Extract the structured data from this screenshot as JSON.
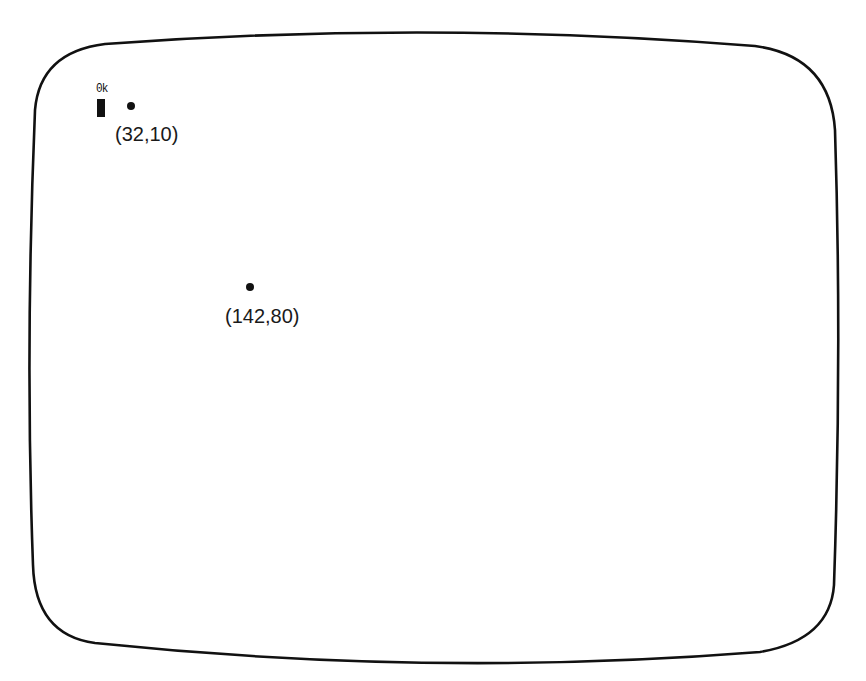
{
  "screen": {
    "prompt": "0k",
    "cursor": "block-cursor"
  },
  "points": [
    {
      "x": 32,
      "y": 10,
      "label": "(32,10)"
    },
    {
      "x": 142,
      "y": 80,
      "label": "(142,80)"
    }
  ],
  "colors": {
    "ink": "#111111",
    "background": "#ffffff"
  }
}
